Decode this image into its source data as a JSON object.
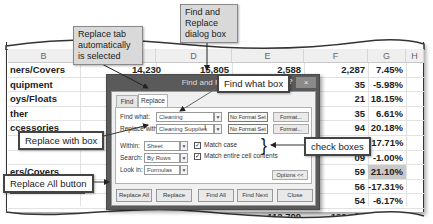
{
  "spreadsheet": {
    "columns": [
      "B",
      "",
      "D",
      "E",
      "F",
      "G",
      "H"
    ],
    "rows": [
      {
        "b": "ners/Covers",
        "d_prev": "14,230",
        "d": "15,805",
        "e": "2,588",
        "f": "2,287",
        "g": "7.45%"
      },
      {
        "b": "quipment",
        "f": "35",
        "g": "-5.98%"
      },
      {
        "b": "oys/Floats",
        "f": "21",
        "g": "18.15%"
      },
      {
        "b": "ther",
        "f": "35",
        "g": "6.61%"
      },
      {
        "b": "ccessories",
        "f": "94",
        "g": "20.18%"
      },
      {
        "b": "",
        "f": "39",
        "g": "-17.71%"
      },
      {
        "b": "",
        "f": "09",
        "g": "-1.00%"
      },
      {
        "b": "ers/Covers",
        "f": "59",
        "g": "21.10%",
        "highlight": true
      },
      {
        "b": "uipment",
        "f": "56",
        "g": "-17.31%"
      },
      {
        "b": "",
        "f": "54",
        "g": "-6.17%"
      },
      {
        "b": "ther",
        "f": "90",
        "g": "4.54%"
      },
      {
        "b": "",
        "c": "720,079",
        "d": "719,899",
        "e": "112,709",
        "f": "120,596",
        "g": "0.93%"
      }
    ]
  },
  "dialog": {
    "title": "Find and Replace",
    "help_icon": "?",
    "close_icon": "×",
    "tabs": [
      {
        "label": "Find",
        "active": false
      },
      {
        "label": "Replace",
        "active": true
      }
    ],
    "find_what_label": "Find what:",
    "find_what_value": "Cleaning",
    "replace_with_label": "Replace with:",
    "replace_with_value": "Cleaning Supplies",
    "no_format_set": "No Format Set",
    "format_button": "Format...",
    "within_label": "Within:",
    "within_value": "Sheet",
    "search_label": "Search:",
    "search_value": "By Rows",
    "look_in_label": "Look in:",
    "look_in_value": "Formulas",
    "match_case_label": "Match case",
    "match_case_checked": true,
    "match_entire_label": "Match entire cell contents",
    "match_entire_checked": true,
    "options_button": "Options <<",
    "buttons": {
      "replace_all": "Replace All",
      "replace": "Replace",
      "find_all": "Find All",
      "find_next": "Find Next",
      "close": "Close"
    }
  },
  "callouts": {
    "replace_tab": "Replace tab automatically is selected",
    "dialog_box": "Find and Replace dialog box",
    "find_what_box": "Find what box",
    "replace_with_box": "Replace with box",
    "check_boxes": "check boxes",
    "replace_all_button": "Replace All button"
  }
}
